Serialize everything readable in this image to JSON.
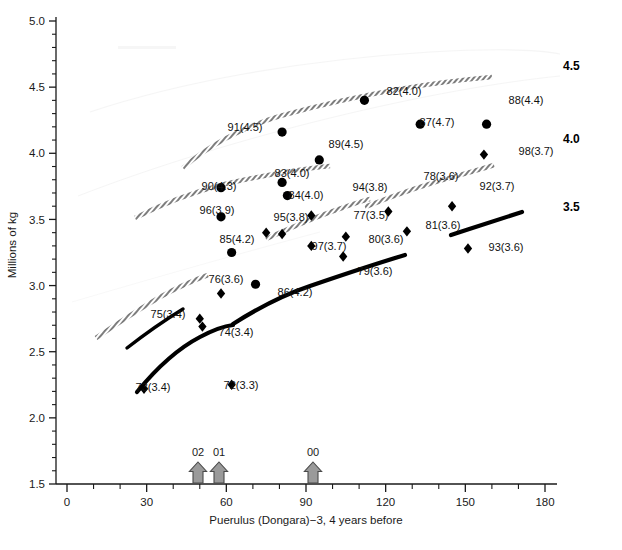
{
  "chart_data": {
    "type": "scatter",
    "title": "",
    "xlabel": "Puerulus (Dongara)−3, 4 years before",
    "ylabel": "Millions of kg",
    "xlim": [
      0,
      180
    ],
    "ylim": [
      1.5,
      5.0
    ],
    "xticks": [
      0,
      30,
      60,
      90,
      120,
      150,
      180
    ],
    "xticklabels": [
      "0",
      "30",
      "60",
      "90",
      "120",
      "150",
      "180"
    ],
    "yticks": [
      1.5,
      2.0,
      2.5,
      3.0,
      3.5,
      4.0,
      4.5,
      5.0
    ],
    "yticklabels": [
      "1.5",
      "2.0",
      "2.5",
      "3.0",
      "3.5",
      "4.0",
      "4.5",
      "5.0"
    ],
    "xminor_step": 10,
    "yminor_step": 0.1,
    "grid": false,
    "legend": null,
    "points": [
      {
        "label": "73(3.4)",
        "year": "73",
        "paren": "3.4",
        "x": 29,
        "y": 2.22,
        "marker": "diamond",
        "lx": 153,
        "ly": 391
      },
      {
        "label": "72(3.3)",
        "year": "72",
        "paren": "3.3",
        "x": 62,
        "y": 2.25,
        "marker": "diamond",
        "lx": 241,
        "ly": 389
      },
      {
        "label": "74(3.4)",
        "year": "74",
        "paren": "3.4",
        "x": 51,
        "y": 2.69,
        "marker": "diamond",
        "lx": 236,
        "ly": 336
      },
      {
        "label": "75(3.4)",
        "year": "75",
        "paren": "3.4",
        "x": 50,
        "y": 2.75,
        "marker": "diamond",
        "lx": 168,
        "ly": 318
      },
      {
        "label": "76(3.6)",
        "year": "76",
        "paren": "3.6",
        "x": 58,
        "y": 2.94,
        "marker": "diamond",
        "lx": 226,
        "ly": 283
      },
      {
        "label": "86(4.2)",
        "year": "86",
        "paren": "4.2",
        "x": 71,
        "y": 3.01,
        "marker": "circle",
        "lx": 295,
        "ly": 296
      },
      {
        "label": "85(4.2)",
        "year": "85",
        "paren": "4.2",
        "x": 62,
        "y": 3.25,
        "marker": "circle",
        "lx": 237,
        "ly": 243
      },
      {
        "label": "96(3.9)",
        "year": "96",
        "paren": "3.9",
        "x": 58,
        "y": 3.52,
        "marker": "circle",
        "lx": 217,
        "ly": 214
      },
      {
        "label": "90(4.3)",
        "year": "90",
        "paren": "4.3",
        "x": 58,
        "y": 3.74,
        "marker": "circle",
        "lx": 219,
        "ly": 190
      },
      {
        "label": "95(3.8)",
        "year": "95",
        "paren": "3.8",
        "x": 75,
        "y": 3.4,
        "marker": "diamond",
        "lx": 291,
        "ly": 221
      },
      {
        "label": "97(3.7)",
        "year": "97",
        "paren": "3.7",
        "x": 81,
        "y": 3.39,
        "marker": "diamond",
        "lx": 329,
        "ly": 250
      },
      {
        "label": "84(4.0)",
        "year": "84",
        "paren": "4.0",
        "x": 83,
        "y": 3.68,
        "marker": "circle",
        "lx": 306,
        "ly": 199
      },
      {
        "label": "83(4.0)",
        "year": "83",
        "paren": "4.0",
        "x": 81,
        "y": 3.78,
        "marker": "circle",
        "lx": 292,
        "ly": 177
      },
      {
        "label": "91(4.5)",
        "year": "91",
        "paren": "4.5",
        "x": 81,
        "y": 4.16,
        "marker": "circle",
        "lx": 245,
        "ly": 131
      },
      {
        "label": "94(3.8)",
        "year": "94",
        "paren": "3.8",
        "x": 92,
        "y": 3.53,
        "marker": "diamond",
        "lx": 370,
        "ly": 191
      },
      {
        "label": "89(4.5)",
        "year": "89",
        "paren": "4.5",
        "x": 95,
        "y": 3.95,
        "marker": "circle",
        "lx": 346,
        "ly": 148
      },
      {
        "label": "77(3.5)",
        "year": "77",
        "paren": "3.5",
        "x": 92,
        "y": 3.3,
        "marker": "diamond",
        "lx": 371,
        "ly": 219
      },
      {
        "label": "79(3.6)",
        "year": "79",
        "paren": "3.6",
        "x": 104,
        "y": 3.22,
        "marker": "diamond",
        "lx": 375,
        "ly": 275
      },
      {
        "label": "80(3.6)",
        "year": "80",
        "paren": "3.6",
        "x": 105,
        "y": 3.37,
        "marker": "diamond",
        "lx": 386,
        "ly": 243
      },
      {
        "label": "82(4.0)",
        "year": "82",
        "paren": "4.0",
        "x": 112,
        "y": 4.4,
        "marker": "circle",
        "lx": 404,
        "ly": 95
      },
      {
        "label": "78(3.6)",
        "year": "78",
        "paren": "3.6",
        "x": 121,
        "y": 3.56,
        "marker": "diamond",
        "lx": 441,
        "ly": 180
      },
      {
        "label": "81(3.6)",
        "year": "81",
        "paren": "3.6",
        "x": 128,
        "y": 3.41,
        "marker": "diamond",
        "lx": 443,
        "ly": 229
      },
      {
        "label": "87(4.7)",
        "year": "87",
        "paren": "4.7",
        "x": 133,
        "y": 4.22,
        "marker": "circle",
        "lx": 437,
        "ly": 126
      },
      {
        "label": "92(3.7)",
        "year": "92",
        "paren": "3.7",
        "x": 145,
        "y": 3.6,
        "marker": "diamond",
        "lx": 497,
        "ly": 190
      },
      {
        "label": "93(3.6)",
        "year": "93",
        "paren": "3.6",
        "x": 151,
        "y": 3.28,
        "marker": "diamond",
        "lx": 506,
        "ly": 251
      },
      {
        "label": "88(4.4)",
        "year": "88",
        "paren": "4.4",
        "x": 158,
        "y": 4.22,
        "marker": "circle",
        "lx": 526,
        "ly": 104
      },
      {
        "label": "98(3.7)",
        "year": "98",
        "paren": "3.7",
        "x": 157,
        "y": 3.99,
        "marker": "diamond",
        "lx": 536,
        "ly": 155
      }
    ],
    "curves": [
      {
        "name": "4.5",
        "label": "4.5",
        "style": "hatched",
        "label_x": 563,
        "label_y": 70,
        "path": "M 183,168 C 205,148 240,128 280,116 C 320,105 360,96 400,89 C 440,82 470,79 492,77"
      },
      {
        "name": "4.0",
        "label": "4.0",
        "style": "hatched",
        "label_x": 563,
        "label_y": 143,
        "path": "M 135,218 C 160,205 190,193 225,184 C 265,175 300,169 330,166"
      },
      {
        "name": "4.0b",
        "label": "",
        "style": "hatched",
        "label_x": 0,
        "label_y": 0,
        "path": "M 365,207 C 395,195 430,183 460,175 C 478,170 488,167 494,165"
      },
      {
        "name": "3.5",
        "label": "3.5",
        "style": "hatched",
        "label_x": 563,
        "label_y": 211,
        "path": "M 96,338 C 115,325 138,310 160,297 C 180,286 197,279 208,275"
      },
      {
        "name": "3.5b",
        "label": "",
        "style": "hatched",
        "label_x": 0,
        "label_y": 0,
        "path": "M 266,239 C 290,228 318,216 342,208 C 356,203 365,200 370,199"
      },
      {
        "name": "3.5c",
        "label": "",
        "style": "solid-thin",
        "label_x": 0,
        "label_y": 0,
        "path": "M 127,348 C 145,334 165,320 183,309"
      },
      {
        "name": "lower-solid",
        "label": "",
        "style": "solid-thick",
        "label_x": 0,
        "label_y": 0,
        "path": "M 137,392 C 155,370 175,350 200,337 C 215,329 225,326 233,325"
      },
      {
        "name": "mid-solid",
        "label": "",
        "style": "solid-thick",
        "label_x": 0,
        "label_y": 0,
        "path": "M 233,324 C 255,310 280,296 310,286 C 345,274 375,264 405,255"
      },
      {
        "name": "right-solid",
        "label": "",
        "style": "solid-thick",
        "label_x": 0,
        "label_y": 0,
        "path": "M 451,235 C 475,227 500,219 522,212"
      }
    ],
    "arrows": [
      {
        "label": "02",
        "x": 198,
        "value": 44
      },
      {
        "label": "01",
        "x": 219,
        "value": 51
      },
      {
        "label": "00",
        "x": 313,
        "value": 85
      }
    ],
    "colors": {
      "axis": "#1a1a1a",
      "marker": "#000000",
      "curve_hatched": "#8a8a8a",
      "curve_solid": "#000000",
      "arrow_fill": "#9a9a9a",
      "arrow_stroke": "#4a4a4a",
      "background": "#ffffff"
    }
  }
}
